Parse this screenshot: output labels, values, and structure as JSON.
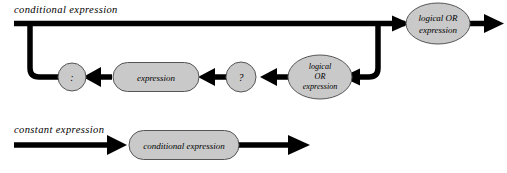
{
  "diagram": {
    "type": "railroad-syntax-diagram",
    "colors": {
      "rail": "#000000",
      "node_fill": "#c9c9c9",
      "node_stroke": "#555555",
      "background": "#ffffff",
      "text": "#000000"
    },
    "rules": [
      {
        "id": "conditional-expression",
        "label": "conditional expression",
        "nodes": [
          {
            "id": "logical-or-right",
            "shape": "ellipse",
            "lines": [
              "logical OR",
              "expression"
            ]
          },
          {
            "id": "colon-token",
            "shape": "circle",
            "lines": [
              ":"
            ]
          },
          {
            "id": "expression",
            "shape": "stadium",
            "lines": [
              "expression"
            ]
          },
          {
            "id": "question-token",
            "shape": "circle",
            "lines": [
              "?"
            ]
          },
          {
            "id": "logical-or-loop",
            "shape": "ellipse",
            "lines": [
              "logical",
              "OR",
              "expression"
            ]
          }
        ]
      },
      {
        "id": "constant-expression",
        "label": "constant expression",
        "nodes": [
          {
            "id": "conditional-expression-node",
            "shape": "stadium",
            "lines": [
              "conditional expression"
            ]
          }
        ]
      }
    ]
  }
}
